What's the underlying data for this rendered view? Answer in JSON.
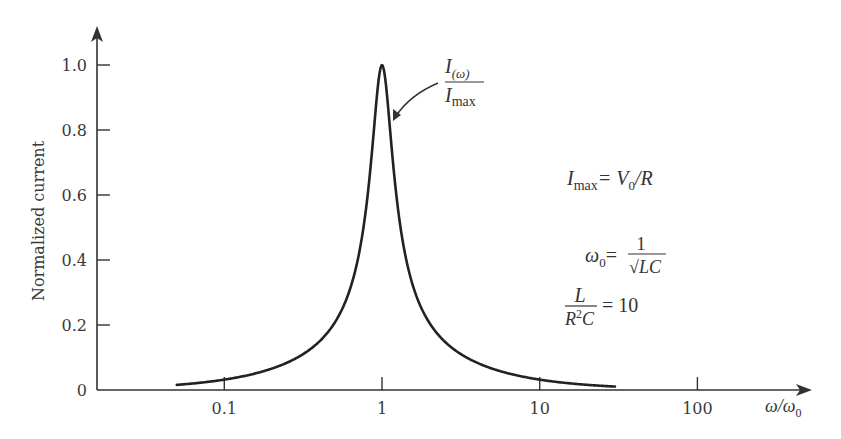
{
  "chart_data": {
    "type": "line",
    "title": "",
    "xlabel": "ω/ω0",
    "ylabel": "Normalized current",
    "xscale": "log",
    "xlim": [
      0.045,
      100
    ],
    "ylim": [
      0,
      1.0
    ],
    "x_ticks": [
      0.1,
      1,
      10,
      100
    ],
    "x_tick_labels": [
      "0.1",
      "1",
      "10",
      "100"
    ],
    "y_ticks": [
      0,
      0.2,
      0.4,
      0.6,
      0.8,
      1.0
    ],
    "y_tick_labels": [
      "0",
      "0.2",
      "0.4",
      "0.6",
      "0.8",
      "1.0"
    ],
    "grid": false,
    "legend": null,
    "series": [
      {
        "name": "I(ω)/Imax",
        "x": [
          0.05,
          0.07,
          0.1,
          0.15,
          0.2,
          0.3,
          0.4,
          0.5,
          0.6,
          0.7,
          0.8,
          0.9,
          0.95,
          1.0,
          1.05,
          1.1,
          1.25,
          1.5,
          2,
          3,
          5,
          7,
          10,
          15,
          20,
          30
        ],
        "values": [
          0.016,
          0.022,
          0.032,
          0.048,
          0.065,
          0.1,
          0.145,
          0.206,
          0.289,
          0.402,
          0.546,
          0.763,
          0.895,
          1.0,
          0.91,
          0.796,
          0.634,
          0.408,
          0.206,
          0.118,
          0.065,
          0.046,
          0.032,
          0.021,
          0.016,
          0.011
        ]
      }
    ],
    "annotations": [
      {
        "text": "I(ω)/Imax",
        "type": "arrow-label",
        "points_to": "curve right flank near peak"
      },
      {
        "text": "Imax = V0/R"
      },
      {
        "text": "ω0 = 1/√(LC)"
      },
      {
        "text": "L/(R²C) = 10"
      }
    ],
    "params": {
      "L_over_R2C": 10
    }
  },
  "labels": {
    "ylabel": "Normalized current",
    "xlabel_num": "ω",
    "xlabel_den": "ω",
    "xlabel_den_sub": "0",
    "curve_label_num": "I",
    "curve_label_num_sub": "(ω)",
    "curve_label_den": "I",
    "curve_label_den_sub": "max",
    "eq1_lhs": "I",
    "eq1_lhs_sub": "max",
    "eq1_rhs": "= V",
    "eq1_rhs_sub": "0",
    "eq1_rhs_tail": "/R",
    "eq2_lhs": "ω",
    "eq2_lhs_sub": "0",
    "eq2_eq": "=",
    "eq2_num": "1",
    "eq2_den": "√LC",
    "eq3_num": "L",
    "eq3_den": "R",
    "eq3_den_sup": "2",
    "eq3_den_tail": "C",
    "eq3_rhs": "= 10"
  },
  "layout": {
    "origin_x": 97,
    "origin_y": 390,
    "x_decade_px": 157.7,
    "x_at_1": 382,
    "y_unit_px": 325,
    "curve_color": "#222222",
    "axis_color": "#333333"
  }
}
